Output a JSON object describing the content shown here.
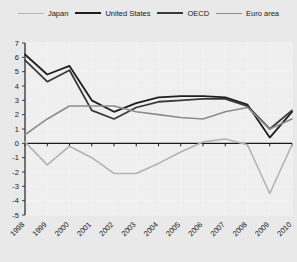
{
  "chart_data": {
    "type": "line",
    "title": "",
    "subtitle": "",
    "xlabel": "",
    "ylabel": "",
    "x": [
      1998,
      1999,
      2000,
      2001,
      2002,
      2003,
      2004,
      2005,
      2006,
      2007,
      2008,
      2009,
      2010
    ],
    "categories": [
      "1998",
      "1999",
      "2000",
      "2001",
      "2002",
      "2003",
      "2004",
      "2005",
      "2006",
      "2007",
      "2008",
      "2009",
      "2010"
    ],
    "xlim": [
      1998,
      2010
    ],
    "ylim": [
      -5,
      7
    ],
    "ytick_values": [
      7,
      6,
      5,
      4,
      3,
      2,
      1,
      0,
      -1,
      -2,
      -3,
      -4,
      -5
    ],
    "ytick_labels": [
      "7",
      "6",
      "5",
      "4",
      "3",
      "2",
      "1",
      "0",
      "-1",
      "-2",
      "-3",
      "-4",
      "-5"
    ],
    "grid": true,
    "legend_position": "top",
    "series": [
      {
        "name": "Japan",
        "color": "#b3b3b3",
        "width": 1.6,
        "values": [
          0.1,
          -1.5,
          -0.2,
          -1.0,
          -2.1,
          -2.1,
          -1.4,
          -0.6,
          0.1,
          0.3,
          -0.1,
          -3.5,
          -0.1
        ]
      },
      {
        "name": "United States",
        "color": "#1f1f1f",
        "width": 1.8,
        "values": [
          6.2,
          4.8,
          5.4,
          3.0,
          2.2,
          2.8,
          3.2,
          3.3,
          3.3,
          3.2,
          2.7,
          0.4,
          2.2
        ]
      },
      {
        "name": "OECD",
        "color": "#3a3a3a",
        "width": 1.8,
        "values": [
          5.8,
          4.3,
          5.1,
          2.3,
          1.7,
          2.5,
          2.9,
          3.0,
          3.1,
          3.1,
          2.6,
          1.0,
          2.3
        ]
      },
      {
        "name": "Euro area",
        "color": "#8c8c8c",
        "width": 1.6,
        "values": [
          0.6,
          1.7,
          2.6,
          2.6,
          2.6,
          2.2,
          2.0,
          1.8,
          1.7,
          2.2,
          2.5,
          1.0,
          1.7
        ]
      }
    ]
  },
  "legend": {
    "items": [
      {
        "label": "Japan",
        "color": "#b3b3b3",
        "width": 1.6
      },
      {
        "label": "United States",
        "color": "#1f1f1f",
        "width": 2.2
      },
      {
        "label": "OECD",
        "color": "#3a3a3a",
        "width": 2.2
      },
      {
        "label": "Euro area",
        "color": "#8c8c8c",
        "width": 1.6
      }
    ]
  },
  "axes": {
    "zero_line_color": "#1a1a1a",
    "axis_color": "#3d3d3d",
    "grid_color": "#f4f4f4",
    "plot_background": "#efefef"
  }
}
